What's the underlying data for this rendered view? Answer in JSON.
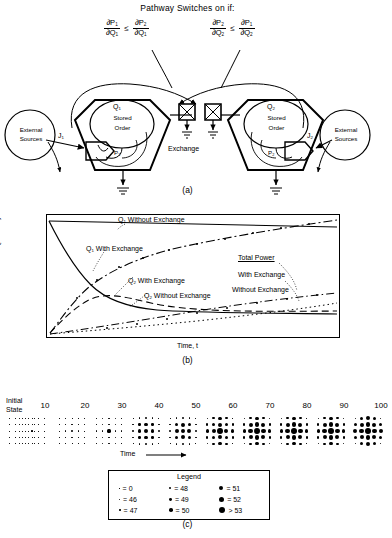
{
  "figure": {
    "title": "Pathway Switches on if:",
    "captions": {
      "a": "(a)",
      "b": "(b)",
      "c": "(c)"
    }
  },
  "conditions": [
    {
      "id": "left",
      "lhs_num": "∂P",
      "lhs_num_sub": "1",
      "lhs_den": "∂Q",
      "lhs_den_sub": "1",
      "rel": "≤",
      "rhs_num": "∂P",
      "rhs_num_sub": "2",
      "rhs_den": "∂Q",
      "rhs_den_sub": "1"
    },
    {
      "id": "right",
      "lhs_num": "∂P",
      "lhs_num_sub": "2",
      "lhs_den": "∂Q",
      "lhs_den_sub": "2",
      "rel": "≤",
      "rhs_num": "∂P",
      "rhs_num_sub": "1",
      "rhs_den": "∂Q",
      "rhs_den_sub": "2"
    }
  ],
  "panel_a": {
    "left_source": "External\nSources",
    "left_source_line1": "External",
    "left_source_line2": "Sources",
    "right_source_line1": "External",
    "right_source_line2": "Sources",
    "left_flow": "J",
    "left_flow_sub": "1",
    "right_flow": "J",
    "right_flow_sub": "2",
    "left_tank_label": "Q",
    "left_tank_sub": "1",
    "left_tank_line1": "Stored",
    "left_tank_line2": "Order",
    "right_tank_label": "Q",
    "right_tank_sub": "2",
    "right_tank_line1": "Stored",
    "right_tank_line2": "Order",
    "left_producer": "P",
    "left_producer_sub": "1",
    "right_producer": "P",
    "right_producer_sub": "2",
    "exchange_label": "Exchange"
  },
  "panel_b": {
    "ylabel": "Quantity",
    "xlabel": "Time, t",
    "annotations": [
      {
        "name": "q1-without-exchange",
        "text": "Q",
        "sub": "1",
        "rest": " Without Exchange"
      },
      {
        "name": "q1-with-exchange",
        "text": "Q",
        "sub": "1",
        "rest": " With Exchange"
      },
      {
        "name": "q2-with-exchange",
        "text": "Q",
        "sub": "2",
        "rest": " With Exchange"
      },
      {
        "name": "q2-without-exchange",
        "text": "Q",
        "sub": "2",
        "rest": " Without Exchange"
      }
    ],
    "total_power_title": "Total Power",
    "total_power_with": "With Exchange",
    "total_power_without": "Without Exchange"
  },
  "chart_data": {
    "type": "line",
    "title": "",
    "xlabel": "Time, t",
    "ylabel": "Quantity",
    "xlim": [
      0,
      100
    ],
    "ylim": [
      0,
      100
    ],
    "grid": false,
    "legend": "inline-annotations",
    "series": [
      {
        "name": "Q1 Without Exchange",
        "style": "solid-flat",
        "x": [
          0,
          10,
          20,
          30,
          40,
          50,
          60,
          70,
          80,
          90,
          100
        ],
        "y": [
          97,
          96.6,
          96.2,
          95.8,
          95.4,
          95,
          94.6,
          94.2,
          93.8,
          93.4,
          93
        ]
      },
      {
        "name": "Q1 With Exchange",
        "style": "solid-decay",
        "x": [
          0,
          5,
          10,
          15,
          20,
          25,
          30,
          40,
          50,
          60,
          70,
          80,
          90,
          100
        ],
        "y": [
          97,
          80,
          64,
          51,
          41,
          34,
          29,
          24,
          21,
          19.5,
          18.5,
          18,
          17.6,
          17.3
        ]
      },
      {
        "name": "Q2 With Exchange",
        "style": "dashdot-rise",
        "x": [
          0,
          5,
          10,
          15,
          20,
          25,
          30,
          40,
          50,
          60,
          70,
          80,
          90,
          100
        ],
        "y": [
          1,
          9,
          19,
          29,
          37,
          44,
          50,
          59,
          66,
          71,
          76,
          80,
          85,
          91
        ]
      },
      {
        "name": "Q2 Without Exchange",
        "style": "dashed-rise",
        "x": [
          0,
          5,
          10,
          15,
          20,
          25,
          30,
          40,
          50,
          60,
          70,
          80,
          90,
          100
        ],
        "y": [
          1,
          8,
          15,
          21,
          26,
          29,
          31,
          32,
          31.5,
          31,
          30.5,
          30,
          29.5,
          29
        ]
      },
      {
        "name": "Total Power With Exchange",
        "style": "dashdot-low",
        "x": [
          0,
          10,
          20,
          30,
          40,
          50,
          60,
          70,
          80,
          90,
          100
        ],
        "y": [
          1,
          3,
          6,
          9,
          12,
          15,
          18,
          21,
          24,
          27,
          30
        ]
      },
      {
        "name": "Total Power Without Exchange",
        "style": "dotted-low",
        "x": [
          0,
          10,
          20,
          30,
          40,
          50,
          60,
          70,
          80,
          90,
          100
        ],
        "y": [
          1,
          5,
          9,
          12,
          15,
          17,
          19,
          21,
          23,
          25,
          27
        ]
      }
    ]
  },
  "panel_c": {
    "time_arrow_label": "Time",
    "initial_state_line1": "Initial",
    "initial_state_line2": "State",
    "columns": [
      "Initial State",
      "10",
      "20",
      "30",
      "40",
      "50",
      "60",
      "70",
      "80",
      "90",
      "100"
    ],
    "column_headers": [
      "10",
      "20",
      "30",
      "40",
      "50",
      "60",
      "70",
      "80",
      "90",
      "100"
    ],
    "legend_title": "Legend",
    "legend_items": [
      {
        "size": 0.6,
        "label": "= 0"
      },
      {
        "size": 1.0,
        "label": "= 46"
      },
      {
        "size": 1.6,
        "label": "= 47"
      },
      {
        "size": 2.2,
        "label": "= 48"
      },
      {
        "size": 2.9,
        "label": "= 49"
      },
      {
        "size": 3.6,
        "label": "= 50"
      },
      {
        "size": 4.4,
        "label": "= 51"
      },
      {
        "size": 5.2,
        "label": "= 52"
      },
      {
        "size": 6.4,
        "label": "> 53"
      }
    ],
    "grids": [
      {
        "label": "Initial State",
        "values": [
          [
            0,
            0,
            0,
            0,
            0
          ],
          [
            0,
            0,
            0,
            0,
            0
          ],
          [
            0,
            0,
            0,
            0,
            0
          ],
          [
            0,
            0,
            0,
            0,
            0
          ],
          [
            0,
            0,
            0,
            0,
            0
          ]
        ]
      },
      {
        "label": "10",
        "values": [
          [
            0,
            0,
            0,
            0,
            0
          ],
          [
            0,
            0,
            0,
            0,
            0
          ],
          [
            0,
            0,
            1,
            0,
            0
          ],
          [
            0,
            0,
            0,
            0,
            0
          ],
          [
            0,
            0,
            0,
            0,
            0
          ]
        ]
      },
      {
        "label": "20",
        "values": [
          [
            0,
            0,
            0,
            0,
            0
          ],
          [
            0,
            0,
            1,
            0,
            0
          ],
          [
            0,
            1,
            2,
            1,
            0
          ],
          [
            0,
            0,
            1,
            0,
            0
          ],
          [
            0,
            0,
            0,
            0,
            0
          ]
        ]
      },
      {
        "label": "30",
        "values": [
          [
            0,
            1,
            1,
            1,
            0
          ],
          [
            0,
            1,
            2,
            1,
            0
          ],
          [
            1,
            2,
            4,
            2,
            1
          ],
          [
            0,
            1,
            2,
            1,
            0
          ],
          [
            0,
            1,
            1,
            1,
            0
          ]
        ]
      },
      {
        "label": "40",
        "values": [
          [
            0,
            2,
            3,
            2,
            0
          ],
          [
            2,
            3,
            4,
            3,
            2
          ],
          [
            3,
            4,
            6,
            4,
            3
          ],
          [
            2,
            3,
            4,
            3,
            2
          ],
          [
            0,
            2,
            3,
            2,
            0
          ]
        ]
      },
      {
        "label": "50",
        "values": [
          [
            0,
            2,
            3,
            2,
            0
          ],
          [
            2,
            4,
            5,
            4,
            2
          ],
          [
            3,
            5,
            6,
            5,
            3
          ],
          [
            2,
            4,
            5,
            4,
            2
          ],
          [
            0,
            2,
            3,
            2,
            0
          ]
        ]
      },
      {
        "label": "60",
        "values": [
          [
            1,
            3,
            4,
            3,
            0
          ],
          [
            3,
            4,
            5,
            4,
            3
          ],
          [
            4,
            5,
            7,
            5,
            4
          ],
          [
            3,
            4,
            5,
            4,
            3
          ],
          [
            1,
            3,
            4,
            3,
            0
          ]
        ]
      },
      {
        "label": "70",
        "values": [
          [
            1,
            3,
            4,
            3,
            1
          ],
          [
            3,
            5,
            6,
            5,
            3
          ],
          [
            4,
            6,
            7,
            6,
            4
          ],
          [
            3,
            5,
            6,
            5,
            3
          ],
          [
            1,
            3,
            4,
            3,
            1
          ]
        ]
      },
      {
        "label": "80",
        "values": [
          [
            1,
            3,
            4,
            3,
            0
          ],
          [
            3,
            5,
            6,
            5,
            3
          ],
          [
            4,
            6,
            7,
            6,
            4
          ],
          [
            3,
            5,
            6,
            5,
            3
          ],
          [
            1,
            3,
            4,
            3,
            0
          ]
        ]
      },
      {
        "label": "90",
        "values": [
          [
            1,
            3,
            4,
            3,
            1
          ],
          [
            3,
            5,
            6,
            5,
            3
          ],
          [
            4,
            6,
            7,
            6,
            4
          ],
          [
            3,
            5,
            6,
            5,
            3
          ],
          [
            1,
            3,
            4,
            3,
            1
          ]
        ]
      },
      {
        "label": "100",
        "values": [
          [
            1,
            4,
            5,
            4,
            1
          ],
          [
            4,
            5,
            6,
            5,
            4
          ],
          [
            5,
            6,
            7,
            6,
            5
          ],
          [
            4,
            5,
            6,
            5,
            4
          ],
          [
            1,
            4,
            5,
            4,
            1
          ]
        ]
      }
    ]
  }
}
